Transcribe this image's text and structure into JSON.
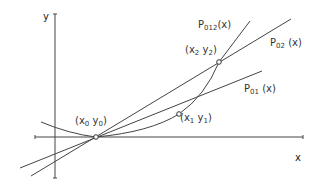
{
  "diagram": {
    "axes": {
      "x_label": "x",
      "y_label": "y"
    },
    "points": [
      {
        "id": "p0",
        "label_main": "(x",
        "sub1": "0",
        "mid": " y",
        "sub2": "0",
        "end": ")"
      },
      {
        "id": "p1",
        "label_main": "(x",
        "sub1": "1",
        "mid": " y",
        "sub2": "1",
        "end": ")"
      },
      {
        "id": "p2",
        "label_main": "(x",
        "sub1": "2",
        "mid": " y",
        "sub2": "2",
        "end": ")"
      }
    ],
    "curves": [
      {
        "id": "p01",
        "label_main": "P",
        "sub": "01",
        "arg": "(x)"
      },
      {
        "id": "p02",
        "label_main": "P",
        "sub": "02",
        "arg": "(x)"
      },
      {
        "id": "p012",
        "label_main": "P",
        "sub": "012",
        "arg": "(x)"
      }
    ],
    "colors": {
      "stroke": "#444444",
      "background": "#ffffff"
    }
  }
}
